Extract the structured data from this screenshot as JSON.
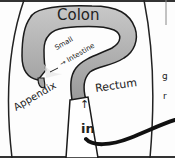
{
  "diagram": {
    "title": "Colon",
    "labels": {
      "colon": "Colon",
      "small_intestine_line1": "Small",
      "small_intestine_line2": "→ Intestine",
      "rectum": "Rectum",
      "appendix": "Appendix",
      "in_arrow": "↑",
      "in": "in",
      "partial_right_1": "g",
      "partial_right_2": "r"
    },
    "colors": {
      "organ_fill": "#b8b8b8",
      "outline": "#1a1a1a",
      "background": "#fdfdfd"
    }
  }
}
